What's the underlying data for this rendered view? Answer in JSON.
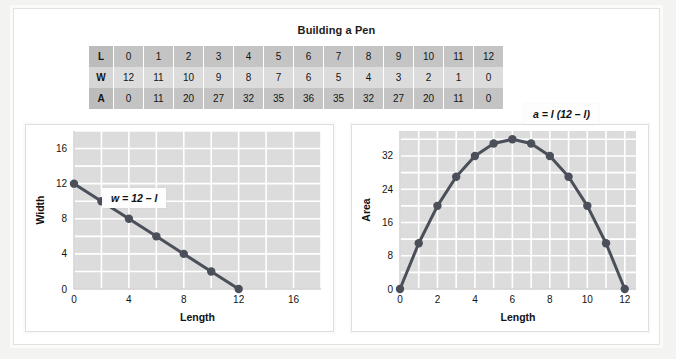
{
  "page": {
    "title": "Building a Pen"
  },
  "table": {
    "rows": [
      {
        "header": "L",
        "values": [
          "0",
          "1",
          "2",
          "3",
          "4",
          "5",
          "6",
          "7",
          "8",
          "9",
          "10",
          "11",
          "12"
        ]
      },
      {
        "header": "W",
        "values": [
          "12",
          "11",
          "10",
          "9",
          "8",
          "7",
          "6",
          "5",
          "4",
          "3",
          "2",
          "1",
          "0"
        ]
      },
      {
        "header": "A",
        "values": [
          "0",
          "11",
          "20",
          "27",
          "32",
          "35",
          "36",
          "35",
          "32",
          "27",
          "20",
          "11",
          "0"
        ]
      }
    ]
  },
  "charts": {
    "left": {
      "equation": "w = 12 – l",
      "xlabel": "Length",
      "ylabel": "Width"
    },
    "right": {
      "equation": "a = l (12 – l)",
      "xlabel": "Length",
      "ylabel": "Area"
    }
  },
  "colors": {
    "plot_background": "#dcdcdc",
    "gridline": "#ffffff",
    "series_line": "#4a4f5a",
    "marker": "#4a4f5a",
    "table_dark_row": "#c4c4c4",
    "table_light_row": "#dcdcdc"
  },
  "chart_data": [
    {
      "type": "line",
      "title": "Building a Pen",
      "xlabel": "Length",
      "ylabel": "Width",
      "x": [
        0,
        2,
        4,
        6,
        8,
        10,
        12
      ],
      "values": [
        12,
        10,
        8,
        6,
        4,
        2,
        0
      ],
      "series": [
        {
          "name": "w = 12 - l",
          "values": [
            12,
            10,
            8,
            6,
            4,
            2,
            0
          ]
        }
      ],
      "xticks": [
        0,
        4,
        8,
        12,
        16
      ],
      "yticks": [
        0,
        4,
        8,
        12,
        16
      ],
      "xlim": [
        0,
        18
      ],
      "ylim": [
        0,
        18
      ],
      "grid": true,
      "legend": "none",
      "annotations": [
        "w = 12 – l"
      ]
    },
    {
      "type": "line",
      "title": "Building a Pen",
      "xlabel": "Length",
      "ylabel": "Area",
      "x": [
        0,
        1,
        2,
        3,
        4,
        5,
        6,
        7,
        8,
        9,
        10,
        11,
        12
      ],
      "values": [
        0,
        11,
        20,
        27,
        32,
        35,
        36,
        35,
        32,
        27,
        20,
        11,
        0
      ],
      "series": [
        {
          "name": "a = l(12 - l)",
          "values": [
            0,
            11,
            20,
            27,
            32,
            35,
            36,
            35,
            32,
            27,
            20,
            11,
            0
          ]
        }
      ],
      "xticks": [
        0,
        2,
        4,
        6,
        8,
        10,
        12
      ],
      "yticks": [
        0,
        8,
        16,
        24,
        32
      ],
      "xlim": [
        0,
        12.6
      ],
      "ylim": [
        0,
        38
      ],
      "grid": true,
      "legend": "none",
      "annotations": [
        "a = l(12 – l)"
      ]
    }
  ]
}
